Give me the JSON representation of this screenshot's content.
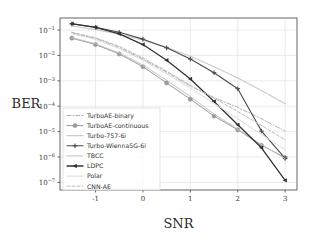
{
  "chart_data": {
    "type": "line",
    "title": "",
    "xlabel": "SNR",
    "ylabel": "BER",
    "xlim": [
      -1.75,
      3.25
    ],
    "ylim": [
      5e-08,
      0.3
    ],
    "yscale": "log",
    "grid": true,
    "legend_position": "lower-left-inside",
    "xticks": [
      "-1",
      "0",
      "1",
      "2",
      "3"
    ],
    "xtick_values": [
      -1,
      0,
      1,
      2,
      3
    ],
    "ytick_labels": [
      "10⁻¹",
      "10⁻²",
      "10⁻³",
      "10⁻⁴",
      "10⁻⁵",
      "10⁻⁶",
      "10⁻⁷"
    ],
    "ytick_values": [
      0.1,
      0.01,
      0.001,
      0.0001,
      1e-05,
      1e-06,
      1e-07
    ],
    "x": [
      -1.5,
      -1,
      -0.5,
      0,
      0.5,
      1,
      1.5,
      2,
      2.5,
      3
    ],
    "series": [
      {
        "name": "TurboAE-binary",
        "color": "#b0b0b0",
        "dash": "4,2,1,2",
        "marker": "none",
        "width": 1.0,
        "values": [
          0.078,
          0.047,
          0.021,
          0.0072,
          0.0022,
          0.00062,
          0.00022,
          9e-05,
          3.2e-05,
          1.05e-05
        ]
      },
      {
        "name": "TurboAE-continuous",
        "color": "#9a9a9a",
        "dash": "none",
        "marker": "circle",
        "width": 1.0,
        "values": [
          0.048,
          0.027,
          0.0115,
          0.0036,
          0.00083,
          0.00019,
          4.1e-05,
          1.18e-05,
          2.9e-06,
          9.5e-07
        ]
      },
      {
        "name": "Turbo-757-6i",
        "color": "#cccccc",
        "dash": "none",
        "marker": "none",
        "width": 1.2,
        "values": [
          0.145,
          0.105,
          0.069,
          0.04,
          0.021,
          0.0093,
          0.0036,
          0.0013,
          0.00042,
          0.000125
        ]
      },
      {
        "name": "Turbo-Wienna5G-6i",
        "color": "#4a4a4a",
        "dash": "none",
        "marker": "plus",
        "width": 1.1,
        "values": [
          0.175,
          0.13,
          0.082,
          0.044,
          0.02,
          0.0072,
          0.0021,
          0.00049,
          1.05e-05,
          8.8e-07
        ]
      },
      {
        "name": "TBCC",
        "color": "#c2c2c2",
        "dash": "none",
        "marker": "none",
        "width": 1.0,
        "values": [
          0.051,
          0.029,
          0.0125,
          0.0042,
          0.00105,
          0.00024,
          4.9e-05,
          1.25e-05,
          3.1e-06,
          8.6e-07
        ]
      },
      {
        "name": "LDPC",
        "color": "#333333",
        "dash": "none",
        "marker": "triangle",
        "width": 1.3,
        "values": [
          0.18,
          0.128,
          0.071,
          0.027,
          0.0065,
          0.00118,
          0.000153,
          1.85e-05,
          2.3e-06,
          1.2e-07
        ]
      },
      {
        "name": "Polar",
        "color": "#dadada",
        "dash": "none",
        "marker": "none",
        "width": 1.0,
        "values": [
          0.072,
          0.043,
          0.019,
          0.0065,
          0.0019,
          0.00052,
          0.00013,
          3.2e-05,
          7.8e-06,
          1.9e-06
        ]
      },
      {
        "name": "CNN-AE",
        "color": "#bdbdbd",
        "dash": "3,2",
        "marker": "none",
        "width": 1.0,
        "values": [
          0.083,
          0.05,
          0.023,
          0.008,
          0.0024,
          0.00068,
          0.00021,
          6.2e-05,
          1.75e-05,
          4.7e-06
        ]
      }
    ]
  },
  "axes": {
    "x_title": "SNR",
    "y_title": "BER"
  }
}
